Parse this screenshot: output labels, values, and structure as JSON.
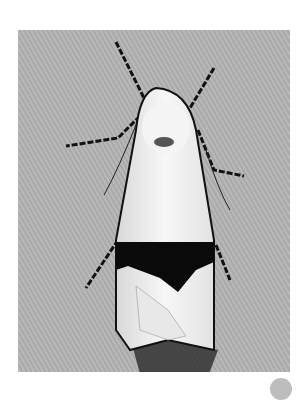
{
  "image": {
    "subject": "white moth with black band on wings resting on fabric",
    "alt": "Moth photograph",
    "colors": {
      "background": "#b8b8b8",
      "wing": "#f2f2f2",
      "band": "#0a0a0a",
      "legs": "#1a1a1a"
    }
  }
}
